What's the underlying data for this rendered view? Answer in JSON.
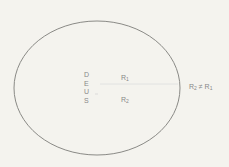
{
  "diagram": {
    "vertical_word": [
      "D",
      "E",
      "U",
      "S"
    ],
    "radius_1": {
      "base": "R",
      "sub": "1"
    },
    "radius_2": {
      "base": "R",
      "sub": "2"
    },
    "relation": {
      "left_base": "R",
      "left_sub": "2",
      "op": "≠",
      "right_base": "R",
      "right_sub": "1"
    }
  }
}
